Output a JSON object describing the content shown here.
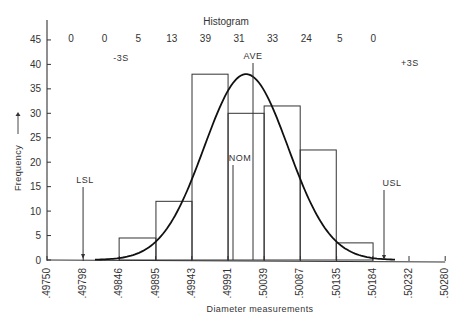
{
  "chart_data": {
    "type": "bar",
    "title": "Histogram",
    "xlabel": "Diameter measurements",
    "ylabel": "Frequency",
    "ylim": [
      0,
      47
    ],
    "grid": false,
    "y_ticks": [
      0,
      5,
      10,
      15,
      20,
      25,
      30,
      35,
      40,
      45
    ],
    "x_ticks": [
      ".49750",
      ".49798",
      ".49846",
      ".49895",
      ".49943",
      ".49991",
      ".50039",
      ".50087",
      ".50135",
      ".50184",
      ".50232",
      ".50280"
    ],
    "bins": [
      {
        "from": ".49846",
        "to": ".49895",
        "height": 4.5
      },
      {
        "from": ".49895",
        "to": ".49943",
        "height": 12
      },
      {
        "from": ".49943",
        "to": ".49991",
        "height": 38
      },
      {
        "from": ".49991",
        "to": ".50039",
        "height": 30
      },
      {
        "from": ".50039",
        "to": ".50087",
        "height": 31.5
      },
      {
        "from": ".50087",
        "to": ".50135",
        "height": 22.5
      },
      {
        "from": ".50135",
        "to": ".50184",
        "height": 3.5
      }
    ],
    "histogram_counts": [
      "0",
      "0",
      "5",
      "13",
      "39",
      "31",
      "33",
      "24",
      "5",
      "0"
    ],
    "normal_curve": {
      "peak": 38,
      "center": ".50015",
      "label": "AVE"
    },
    "annotations": [
      {
        "label": "LSL",
        "x": ".49798"
      },
      {
        "label": "NOM",
        "x": ".50000"
      },
      {
        "label": "AVE",
        "x": ".50015"
      },
      {
        "label": "USL",
        "x": ".50210"
      },
      {
        "label": "-3S",
        "x": ".49880"
      },
      {
        "label": "+3S",
        "x": ".50240"
      }
    ]
  },
  "labels": {
    "title": "Histogram",
    "xlabel": "Diameter measurements",
    "ylabel": "Frequency",
    "ylabel_arrow": "—→",
    "lsl": "LSL",
    "usl": "USL",
    "nom": "NOM",
    "ave": "AVE",
    "minus3s": "-3S",
    "plus3s": "+3S"
  }
}
